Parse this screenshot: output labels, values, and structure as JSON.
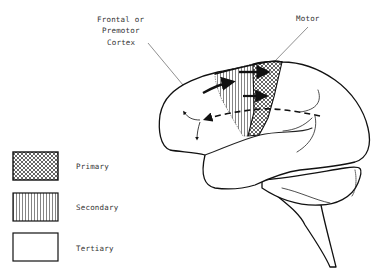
{
  "diagram": {
    "type": "brain-lateral-view",
    "labels": {
      "frontal_line1": "Frontal or",
      "frontal_line2": "Premotor",
      "frontal_line3": "Cortex",
      "motor": "Motor"
    },
    "legend": {
      "items": [
        {
          "label": "Primary",
          "pattern": "crosshatch"
        },
        {
          "label": "Secondary",
          "pattern": "vertical-lines"
        },
        {
          "label": "Tertiary",
          "pattern": "blank"
        }
      ]
    },
    "colors": {
      "ink": "#111111",
      "background": "#ffffff"
    }
  }
}
